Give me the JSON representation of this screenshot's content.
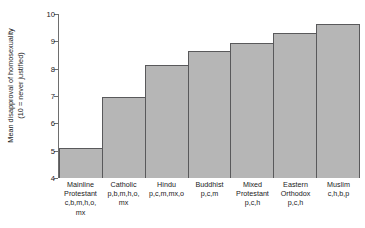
{
  "chart_data": {
    "type": "bar",
    "title": "",
    "xlabel": "",
    "ylabel": "Mean disapproval of homosexuality (10 = never justified)",
    "ylabel_line1": "Mean disapproval of homosexuality",
    "ylabel_line2": "(10 = never justified)",
    "ylim": [
      4,
      10
    ],
    "yticks": [
      4,
      5,
      6,
      7,
      8,
      9,
      10
    ],
    "ytick_labels": [
      "4",
      "5",
      "6",
      "7",
      "8",
      "9",
      "10"
    ],
    "grid": false,
    "legend": "none",
    "bar_color": "#b6b6b6",
    "bar_edge_color": "#59595b",
    "categories": [
      "Mainline Protestant",
      "Catholic",
      "Hindu",
      "Buddhist",
      "Mixed Protestant",
      "Eastern Orthodox",
      "Muslim"
    ],
    "category_codes": [
      "c,b,m,h,o, mx",
      "p,b,m,h,o, mx",
      "p,c,m,mx,o",
      "p,c,m",
      "p,c,h",
      "p,c,h",
      "c,h,b,p"
    ],
    "values": [
      5.1,
      6.95,
      8.15,
      8.65,
      8.95,
      9.3,
      9.65
    ]
  },
  "bars": [
    {
      "name": "Mainline Protestant",
      "name_display": "Mainline",
      "name_display2": "Protestant",
      "codes": "c,b,m,h,o,",
      "codes2": "mx",
      "value": 5.1
    },
    {
      "name": "Catholic",
      "name_display": "Catholic",
      "name_display2": "",
      "codes": "p,b,m,h,o,",
      "codes2": "mx",
      "value": 6.95
    },
    {
      "name": "Hindu",
      "name_display": "Hindu",
      "name_display2": "",
      "codes": "p,c,m,mx,o",
      "codes2": "",
      "value": 8.15
    },
    {
      "name": "Buddhist",
      "name_display": "Buddhist",
      "name_display2": "",
      "codes": "p,c,m",
      "codes2": "",
      "value": 8.65
    },
    {
      "name": "Mixed Protestant",
      "name_display": "Mixed",
      "name_display2": "Protestant",
      "codes": "p,c,h",
      "codes2": "",
      "value": 8.95
    },
    {
      "name": "Eastern Orthodox",
      "name_display": "Eastern",
      "name_display2": "Orthodox",
      "codes": "p,c,h",
      "codes2": "",
      "value": 9.3
    },
    {
      "name": "Muslim",
      "name_display": "Muslim",
      "name_display2": "",
      "codes": "c,h,b,p",
      "codes2": "",
      "value": 9.65
    }
  ],
  "yticks": [
    {
      "value": 10,
      "label": "10"
    },
    {
      "value": 9,
      "label": "9"
    },
    {
      "value": 8,
      "label": "8"
    },
    {
      "value": 7,
      "label": "7"
    },
    {
      "value": 6,
      "label": "6"
    },
    {
      "value": 5,
      "label": "5"
    },
    {
      "value": 4,
      "label": "4"
    }
  ]
}
